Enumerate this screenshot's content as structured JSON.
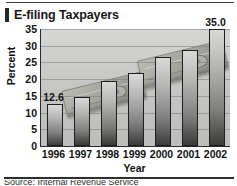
{
  "chart_data": {
    "type": "bar",
    "title": "E-filing Taxpayers",
    "xlabel": "Year",
    "ylabel": "Percent",
    "categories": [
      "1996",
      "1997",
      "1998",
      "1999",
      "2000",
      "2001",
      "2002"
    ],
    "values": [
      12.6,
      14.8,
      19.3,
      21.8,
      26.5,
      28.7,
      35.0
    ],
    "data_labels": [
      {
        "category": "1996",
        "text": "12.6"
      },
      {
        "category": "2002",
        "text": "35.0"
      }
    ],
    "ylim": [
      0,
      35
    ],
    "yticks": [
      "0",
      "5",
      "10",
      "15",
      "20",
      "25",
      "30",
      "35"
    ],
    "ytick_values": [
      0,
      5,
      10,
      15,
      20,
      25,
      30,
      35
    ],
    "grid": true,
    "legend": false,
    "annotations": [
      "stacks of banknotes watermark behind bars"
    ]
  },
  "figure": {
    "title": "E-filing Taxpayers",
    "bottom_caption": "Source: Internal Revenue Service"
  },
  "colors": {
    "plot_background": "#c9c9c7",
    "bar_top": "#d9d9d7",
    "bar_bottom": "#3a3a38",
    "bar_border": "#1e1e1e",
    "text": "#111111",
    "title_accent": "#262626"
  },
  "icons": {
    "money_seal": "$"
  }
}
